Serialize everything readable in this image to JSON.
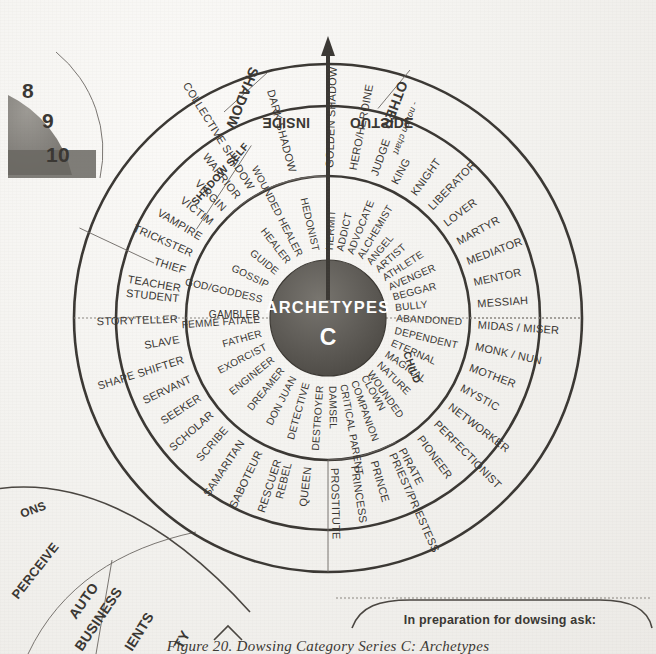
{
  "page": {
    "background_color": "#f2f1ee",
    "ink_color": "#3a3733",
    "caption": "Figure 20. Dowsing Category Series C: Archetypes"
  },
  "chart_data": {
    "type": "pie",
    "title": "ARCHETYPES",
    "subtitle": "C",
    "center_label": "ARCHETYPES",
    "center_series_letter": "C",
    "center_fill": "#5e5b57",
    "center_text_color": "#ffffff",
    "axis_labels": {
      "pointer": "vertical arrow at 12 o'clock",
      "left_of_pointer": "INSIDE",
      "right_of_pointer": "OUTSIDE",
      "shadow_sector": "SHADOW",
      "other_sector": "OTHER",
      "other_note": "- not on chart",
      "shadow_self_sector": "SHADOW SELF",
      "child_sector": "CHILD"
    },
    "rings": [
      {
        "name": "inner",
        "radius_px": 112,
        "items": [
          "HERMIT",
          "ADDICT",
          "ADVOCATE",
          "ALCHEMIST",
          "ANGEL",
          "ARTIST",
          "ATHLETE",
          "AVENGER",
          "BEGGAR",
          "BULLY",
          "ABANDONED",
          "DEPENDENT",
          "ETERNAL",
          "MAGICAL",
          "NATURE",
          "WOUNDED",
          "CLOWN",
          "COMPANION",
          "CRITICAL PARENT",
          "DAMSEL",
          "DESTROYER",
          "DETECTIVE",
          "DON JUAN",
          "DREAMER",
          "ENGINEER",
          "EXORCIST",
          "FATHER",
          "FEMME FATALE",
          "GAMBLER",
          "GOD/GODDESS",
          "GOSSIP",
          "GUIDE",
          "HEALER",
          "WOUNDED HEALER",
          "HEDONIST"
        ]
      },
      {
        "name": "outer",
        "radius_px": 206,
        "items": [
          "HERO/HEROINE",
          "JUDGE",
          "KING",
          "KNIGHT",
          "LIBERATOR",
          "LOVER",
          "MARTYR",
          "MEDIATOR",
          "MENTOR",
          "MESSIAH",
          "MIDAS / MISER",
          "MONK / NUN",
          "MOTHER",
          "MYSTIC",
          "NETWORKER",
          "PERFECTIONIST",
          "PIONEER",
          "PIRATE",
          "PRIEST/PRIESTESS",
          "PRINCE",
          "PRINCESS",
          "PROSTITUTE",
          "QUEEN",
          "REBEL",
          "RESCUER",
          "SABOTEUR",
          "SAMARITAN",
          "SCRIBE",
          "SCHOLAR",
          "SEEKER",
          "SERVANT",
          "SHAPE SHIFTER",
          "SLAVE",
          "STORYTELLER",
          "STUDENT",
          "TEACHER",
          "THIEF",
          "TRICKSTER",
          "VAMPIRE",
          "VICTIM",
          "VIRGIN",
          "WARRIOR",
          "COLLECTIVE SHADOW",
          "DARK SHADOW",
          "GOLDEN SHADOW"
        ]
      }
    ],
    "inner_ring_sectors": {
      "outside_right": [
        "HERMIT",
        "ADDICT",
        "ADVOCATE",
        "ALCHEMIST",
        "ANGEL",
        "ARTIST",
        "ATHLETE",
        "AVENGER",
        "BEGGAR",
        "BULLY"
      ],
      "child_bottom_right": [
        "ABANDONED",
        "DEPENDENT",
        "ETERNAL",
        "MAGICAL",
        "NATURE",
        "WOUNDED"
      ],
      "bottom_center": [
        "CLOWN",
        "COMPANION",
        "CRITICAL PARENT",
        "DAMSEL"
      ],
      "bottom_left": [
        "DESTROYER",
        "DETECTIVE",
        "DON JUAN",
        "DREAMER",
        "ENGINEER",
        "EXORCIST",
        "FATHER",
        "FEMME FATALE"
      ],
      "left": [
        "GAMBLER",
        "GOD/GODDESS",
        "GOSSIP",
        "GUIDE",
        "HEALER"
      ],
      "shadow_self_top_left": [
        "WOUNDED HEALER",
        "HEDONIST"
      ]
    },
    "outer_ring_sectors": {
      "other_top_right": [
        "HERO/HEROINE",
        "JUDGE",
        "KING",
        "KNIGHT",
        "LIBERATOR",
        "LOVER",
        "MARTYR",
        "MEDIATOR",
        "MENTOR",
        "MESSIAH"
      ],
      "right_lower": [
        "MIDAS / MISER",
        "MONK / NUN",
        "MOTHER",
        "MYSTIC",
        "NETWORKER",
        "PERFECTIONIST",
        "PIONEER",
        "PIRATE"
      ],
      "bottom_right": [
        "PRIEST/PRIESTESS",
        "PRINCE",
        "PRINCESS",
        "PROSTITUTE",
        "QUEEN",
        "REBEL"
      ],
      "bottom_left": [
        "RESCUER",
        "SABOTEUR",
        "SAMARITAN",
        "SCRIBE",
        "SCHOLAR",
        "SEEKER",
        "SERVANT",
        "SHAPE SHIFTER",
        "SLAVE",
        "STORYTELLER",
        "STUDENT"
      ],
      "left": [
        "TEACHER",
        "THIEF",
        "TRICKSTER",
        "VAMPIRE",
        "VICTIM",
        "VIRGIN",
        "WARRIOR"
      ],
      "shadow_top_left": [
        "COLLECTIVE SHADOW",
        "DARK SHADOW",
        "GOLDEN SHADOW"
      ]
    }
  },
  "neighbor_figures": {
    "top_left_gauge": {
      "ticks": [
        "8",
        "9",
        "10"
      ]
    },
    "bottom_left_chart": {
      "fragments": [
        "ONS",
        "PERCEIVE",
        "AUTO",
        "BUSINESS",
        "IENTS",
        "TY"
      ]
    },
    "bottom_right_box": {
      "text": "In preparation for dowsing ask:"
    }
  }
}
